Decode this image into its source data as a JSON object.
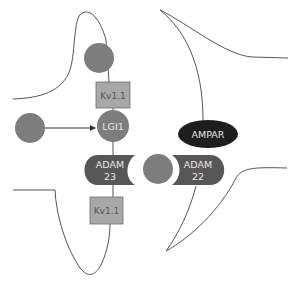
{
  "diagram": {
    "title": "",
    "colors": {
      "background": "#ffffff",
      "membrane_line": "#555555",
      "circle_fill": "#7d7d7d",
      "kv_box_fill": "#a8a8a8",
      "kv_box_stroke": "#6d6d6d",
      "kv_text": "#555555",
      "adam_fill": "#575757",
      "adam_text": "#e6e6e6",
      "ampar_fill": "#1e1e1e",
      "ampar_text": "#e6e6e6"
    },
    "nodes": {
      "kv11_top": {
        "label": "Kv1.1",
        "shape": "rectangle"
      },
      "lgi1": {
        "label": "LGI1",
        "shape": "circle"
      },
      "adam23": {
        "label_line1": "ADAM",
        "label_line2": "23",
        "shape": "concave-right-pill"
      },
      "adam22": {
        "label_line1": "ADAM",
        "label_line2": "22",
        "shape": "concave-left-pill"
      },
      "ampar": {
        "label": "AMPAR",
        "shape": "ellipse"
      },
      "kv11_bottom": {
        "label": "Kv1.1",
        "shape": "rectangle"
      },
      "top_circle": {
        "label": "",
        "shape": "circle"
      },
      "left_circle": {
        "label": "",
        "shape": "circle"
      },
      "middle_circle": {
        "label": "",
        "shape": "circle"
      }
    },
    "edges": [
      {
        "from": "left_circle",
        "to": "lgi1",
        "type": "arrow"
      }
    ],
    "regions": [
      {
        "name": "presynaptic-terminal",
        "side": "left"
      },
      {
        "name": "postsynaptic-terminal",
        "side": "right"
      }
    ]
  }
}
